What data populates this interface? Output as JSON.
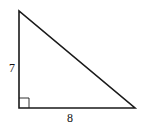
{
  "diagram": {
    "type": "right-triangle",
    "stroke_color": "#1a1a1a",
    "background": "#ffffff",
    "vertices": {
      "top": [
        19,
        11
      ],
      "right_angle": [
        19,
        108
      ],
      "bottom_right": [
        135,
        108
      ]
    },
    "right_angle_marker_size": 10,
    "labels": {
      "vertical_leg": "7",
      "horizontal_leg": "8"
    }
  }
}
